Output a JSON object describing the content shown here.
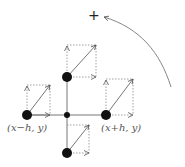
{
  "diagram": {
    "type": "stencil-vector-diagram",
    "plus_symbol": "+",
    "labels": {
      "left": "(x−h, y)",
      "right": "(x+h, y)"
    },
    "nodes": [
      {
        "id": "center",
        "x": 67,
        "y": 115,
        "r": 3
      },
      {
        "id": "left",
        "x": 27,
        "y": 115,
        "r": 5
      },
      {
        "id": "right",
        "x": 106,
        "y": 115,
        "r": 5
      },
      {
        "id": "top",
        "x": 67,
        "y": 77,
        "r": 5
      },
      {
        "id": "bottom",
        "x": 67,
        "y": 153,
        "r": 5
      }
    ],
    "colors": {
      "node": "#111111",
      "line": "#777777",
      "dotted": "#888888",
      "label": "#555555"
    }
  }
}
